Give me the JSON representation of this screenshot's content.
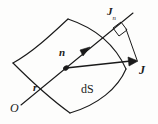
{
  "figure": {
    "stroke_color": "#1a1a1a",
    "background_color": "#fdfdfc",
    "labels": {
      "normal_component": {
        "symbol": "J",
        "subscript": "n"
      },
      "vector_field": {
        "symbol": "J"
      },
      "unit_normal": {
        "symbol": "n"
      },
      "position_vector": {
        "symbol": "r"
      },
      "origin": {
        "symbol": "O"
      },
      "surface_element": {
        "symbol": "dS"
      }
    },
    "geometry": {
      "surface_vertices": [
        {
          "name": "left-vertex",
          "x": 13,
          "y": 63
        },
        {
          "name": "top-vertex",
          "x": 68,
          "y": 19
        },
        {
          "name": "right-vertex",
          "x": 126,
          "y": 69
        },
        {
          "name": "bottom-vertex",
          "x": 70,
          "y": 113
        }
      ],
      "point_on_surface": {
        "x": 66,
        "y": 68
      },
      "normal_arrow_tip": {
        "x": 89,
        "y": 48
      },
      "normal_line_tip": {
        "x": 133,
        "y": 13
      },
      "J_arrow_tip": {
        "x": 137,
        "y": 62
      },
      "origin_point": {
        "x": 21,
        "y": 100
      },
      "right_angle_marker": {
        "x": 118,
        "y": 31
      }
    }
  }
}
